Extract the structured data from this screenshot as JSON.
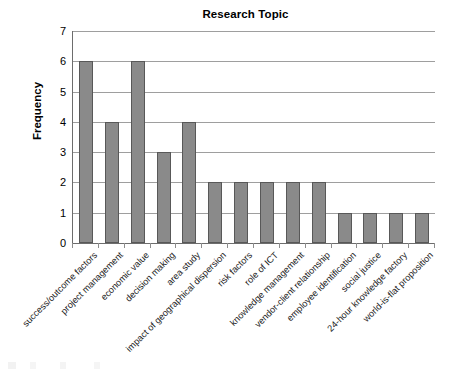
{
  "chart_data": {
    "type": "bar",
    "title": "Research Topic",
    "xlabel": "",
    "ylabel": "Frequency",
    "ylim": [
      0,
      7
    ],
    "yticks": [
      0,
      1,
      2,
      3,
      4,
      5,
      6,
      7
    ],
    "grid": true,
    "legend": false,
    "orientation": "vertical",
    "bar_color": "#8a8a8a",
    "bar_border_color": "#585858",
    "categories": [
      "success/outcome factors",
      "project management",
      "economic value",
      "decision making",
      "area study",
      "impact of geographical dispersion",
      "risk factors",
      "role of ICT",
      "knowledge management",
      "vendor-client relationship",
      "employee identification",
      "social justice",
      "24-hour knowledge factory",
      "world-is-flat proposition"
    ],
    "values": [
      6,
      4,
      6,
      3,
      4,
      2,
      2,
      2,
      2,
      2,
      1,
      1,
      1,
      1
    ]
  }
}
